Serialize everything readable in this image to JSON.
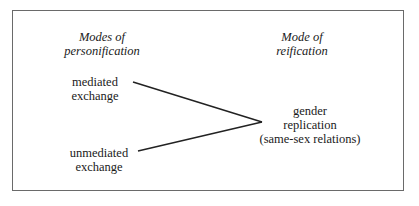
{
  "diagram": {
    "columns": {
      "left_heading": [
        "Modes of",
        "personification"
      ],
      "right_heading": [
        "Mode of",
        "reification"
      ]
    },
    "nodes": {
      "mediated": [
        "mediated",
        "exchange"
      ],
      "unmediated": [
        "unmediated",
        "exchange"
      ],
      "target": [
        "gender",
        "replication",
        "(same-sex relations)"
      ]
    },
    "edges": [
      {
        "from": "mediated",
        "to": "target"
      },
      {
        "from": "unmediated",
        "to": "target"
      }
    ]
  }
}
